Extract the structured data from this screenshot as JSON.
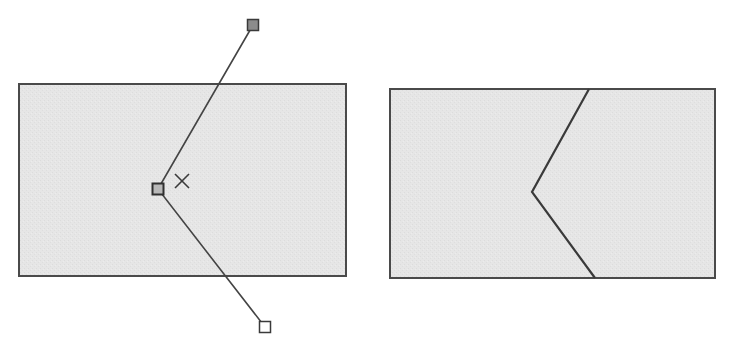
{
  "diagram": {
    "colors": {
      "background": "#ffffff",
      "shape_fill": "#e5e5e5",
      "shape_stroke": "#4a4a4a",
      "path_stroke": "#444444",
      "handle_selected_fill": "#8c8c8c",
      "handle_unselected_fill": "#ffffff",
      "cursor": "#3a3a3a"
    },
    "panels": [
      {
        "id": "before",
        "description": "Rectangle with a polyline being edited; middle node dragged left",
        "rect": {
          "x": 19,
          "y": 84,
          "w": 327,
          "h": 192
        },
        "path_nodes": [
          {
            "x": 253,
            "y": 25,
            "handle": "filled"
          },
          {
            "x": 158,
            "y": 189,
            "handle": "filled-selected"
          },
          {
            "x": 265,
            "y": 327,
            "handle": "empty"
          }
        ],
        "cursor": {
          "type": "x-cross",
          "x": 182,
          "y": 181,
          "size": 14
        }
      },
      {
        "id": "after",
        "description": "Resulting rectangle split by a chevron-shaped cut line",
        "rect": {
          "x": 390,
          "y": 89,
          "w": 325,
          "h": 189
        },
        "cut_line": [
          {
            "x": 589,
            "y": 89
          },
          {
            "x": 532,
            "y": 192
          },
          {
            "x": 595,
            "y": 278
          }
        ]
      }
    ],
    "caption": ""
  }
}
